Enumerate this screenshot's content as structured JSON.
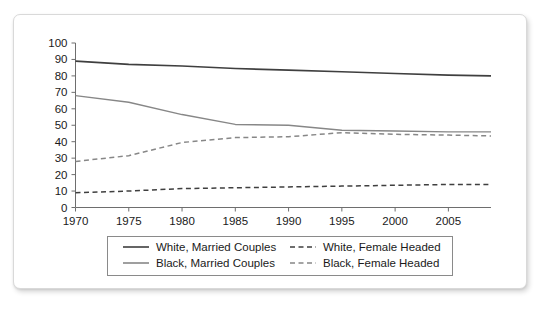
{
  "chart_data": {
    "type": "line",
    "title": "",
    "subtitle": "",
    "xlabel": "",
    "ylabel": "",
    "xlim": [
      1970,
      2009
    ],
    "ylim": [
      0,
      100
    ],
    "grid": false,
    "legend_position": "bottom",
    "x_ticks": [
      "1970",
      "1975",
      "1980",
      "1985",
      "1990",
      "1995",
      "2000",
      "2005"
    ],
    "x_tick_values": [
      1970,
      1975,
      1980,
      1985,
      1990,
      1995,
      2000,
      2005
    ],
    "y_ticks": [
      "0",
      "10",
      "20",
      "30",
      "40",
      "50",
      "60",
      "70",
      "80",
      "90",
      "100"
    ],
    "y_tick_values": [
      0,
      10,
      20,
      30,
      40,
      50,
      60,
      70,
      80,
      90,
      100
    ],
    "x": [
      1970,
      1975,
      1980,
      1985,
      1990,
      1995,
      2000,
      2005,
      2009
    ],
    "series": [
      {
        "name": "White, Married Couples",
        "style": "solid",
        "color": "#3f3f3f",
        "width": 1.6,
        "values": [
          89,
          87,
          86,
          84.5,
          83.5,
          82.5,
          81.5,
          80.5,
          80
        ]
      },
      {
        "name": "Black, Married Couples",
        "style": "solid",
        "color": "#878787",
        "width": 1.4,
        "values": [
          68,
          64,
          56.5,
          50.5,
          50,
          47,
          46.5,
          46,
          46
        ]
      },
      {
        "name": "White, Female Headed",
        "style": "dashed",
        "color": "#3f3f3f",
        "width": 1.5,
        "values": [
          9,
          10,
          11.5,
          12,
          12.5,
          13,
          13.5,
          14,
          14
        ]
      },
      {
        "name": "Black, Female Headed",
        "style": "dashed",
        "color": "#878787",
        "width": 1.5,
        "values": [
          28,
          31.5,
          39.5,
          42.5,
          43,
          45.5,
          44.5,
          44,
          43.5
        ]
      }
    ],
    "legend": [
      {
        "label": "White, Married Couples",
        "style": "solid",
        "color": "#3f3f3f"
      },
      {
        "label": "White, Female Headed",
        "style": "dashed",
        "color": "#3f3f3f"
      },
      {
        "label": "Black, Married Couples",
        "style": "solid",
        "color": "#878787"
      },
      {
        "label": "Black, Female Headed",
        "style": "dashed",
        "color": "#878787"
      }
    ]
  },
  "canvas": {
    "background": "#ffffff",
    "card_background": "#ffffff",
    "card_border": "#d9d9d9",
    "axis_color": "#6e6e6e",
    "text_color": "#1a1a1a"
  }
}
